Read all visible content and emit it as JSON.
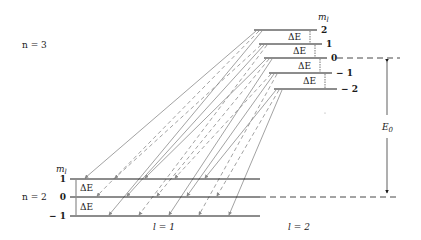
{
  "diagram": {
    "upper_shell": {
      "label": "n = 3",
      "sublabel": "l = 2",
      "ml_header": "m",
      "ml_sub": "l",
      "levels": [
        {
          "ml": "2",
          "y": 30,
          "x1": 254,
          "x2": 317
        },
        {
          "ml": "1",
          "y": 44,
          "x1": 259,
          "x2": 322
        },
        {
          "ml": "0",
          "y": 58,
          "x1": 264,
          "x2": 327
        },
        {
          "ml": "− 1",
          "y": 73,
          "x1": 269,
          "x2": 332
        },
        {
          "ml": "− 2",
          "y": 89,
          "x1": 274,
          "x2": 337
        }
      ],
      "spacing_label": "ΔE"
    },
    "lower_shell": {
      "label": "n = 2",
      "sublabel": "l = 1",
      "ml_header": "m",
      "ml_sub": "l",
      "levels": [
        {
          "ml": "1",
          "y": 179,
          "x1": 70,
          "x2": 260
        },
        {
          "ml": "0",
          "y": 197,
          "x1": 70,
          "x2": 260
        },
        {
          "ml": "− 1",
          "y": 216,
          "x1": 70,
          "x2": 260
        }
      ],
      "spacing_label": "ΔE"
    },
    "energy_gap": {
      "label": "E",
      "sub": "0"
    },
    "colors": {
      "line": "#1a1a1a",
      "transition": "#8a8a8a"
    }
  }
}
